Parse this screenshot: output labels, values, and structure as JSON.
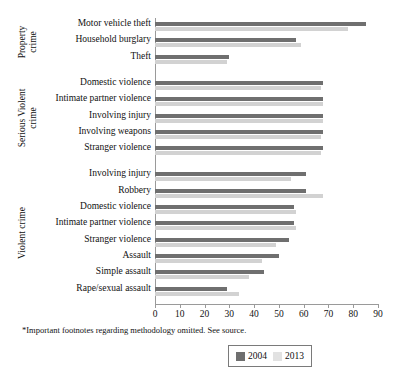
{
  "chart_data": {
    "type": "bar",
    "orientation": "horizontal",
    "title": "",
    "xlabel": "",
    "ylabel": "",
    "xlim": [
      0,
      90
    ],
    "xticks": [
      0,
      10,
      20,
      30,
      40,
      50,
      60,
      70,
      80,
      90
    ],
    "grid": false,
    "legend_position": "bottom-right",
    "legend": [
      "2004",
      "2013"
    ],
    "colors": {
      "s2004": "#6f6f6f",
      "s2013": "#d2d2d2",
      "axis": "#9a9a9a",
      "text": "#111111"
    },
    "groups": [
      {
        "name": "Property crime",
        "name_lines": [
          "Property",
          "crime"
        ],
        "categories": [
          "Motor vehicle theft",
          "Household burglary",
          "Theft"
        ],
        "series": [
          {
            "name": "2004",
            "values": [
              85,
              57,
              30
            ]
          },
          {
            "name": "2013",
            "values": [
              78,
              59,
              29
            ]
          }
        ]
      },
      {
        "name": "Serious Violent crime",
        "name_lines": [
          "Serious Violent",
          "crime"
        ],
        "categories": [
          "Domestic violence",
          "Intimate partner violence",
          "Involving injury",
          "Involving weapons",
          "Stranger violence"
        ],
        "series": [
          {
            "name": "2004",
            "values": [
              68,
              68,
              68,
              68,
              68
            ]
          },
          {
            "name": "2013",
            "values": [
              67,
              68,
              68,
              67,
              67
            ]
          }
        ]
      },
      {
        "name": "Violent crime",
        "name_lines": [
          "Violent crime"
        ],
        "categories": [
          "Involving injury",
          "Robbery",
          "Domestic violence",
          "Intimate partner violence",
          "Stranger violence",
          "Assault",
          "Simple assault",
          "Rape/sexual assault"
        ],
        "series": [
          {
            "name": "2004",
            "values": [
              61,
              61,
              56,
              56,
              54,
              50,
              44,
              29
            ]
          },
          {
            "name": "2013",
            "values": [
              55,
              68,
              57,
              57,
              49,
              43,
              38,
              34
            ]
          }
        ]
      }
    ]
  },
  "footnote": "*Important footnotes regarding methodology omitted. See source."
}
